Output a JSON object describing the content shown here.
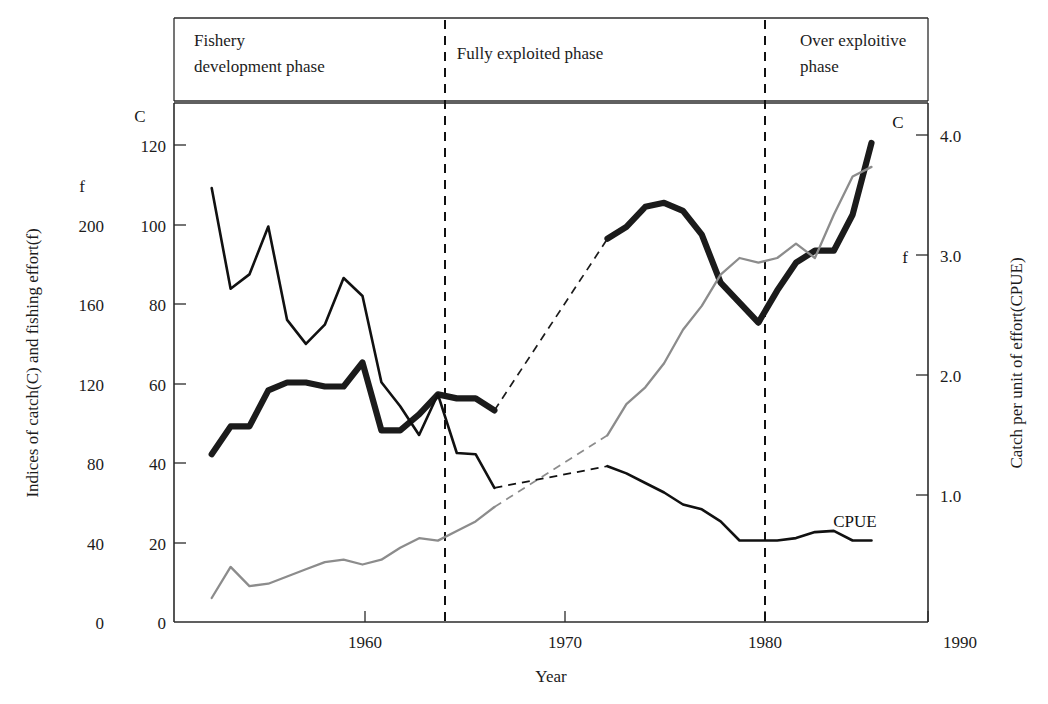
{
  "chart_data": {
    "type": "line",
    "title": "",
    "xlabel": "Year",
    "ylabel": "Indices of catch(C) and fishing effort(f)",
    "y2label": "Catch per unit of effort(CPUE)",
    "xlim": [
      1950,
      1990
    ],
    "xticks": [
      "1960",
      "1970",
      "1980",
      "1990"
    ],
    "xtick_values": [
      1960,
      1970,
      1980,
      1990
    ],
    "grid": false,
    "legend_position": "inline-right-end",
    "axis_c": {
      "name": "C",
      "unit_label": "C",
      "ticks": [
        "0",
        "20",
        "40",
        "60",
        "80",
        "100",
        "120"
      ],
      "tick_values": [
        0,
        20,
        40,
        60,
        80,
        100,
        120
      ],
      "ylim": [
        0,
        130
      ]
    },
    "axis_f": {
      "name": "f",
      "unit_label": "f",
      "ticks": [
        "0",
        "40",
        "80",
        "120",
        "160",
        "200"
      ],
      "tick_values": [
        0,
        40,
        80,
        120,
        160,
        200
      ],
      "ylim": [
        0,
        216.7
      ]
    },
    "axis_cpue": {
      "name": "CPUE",
      "ticks": [
        "1.0",
        "2.0",
        "3.0",
        "4.0"
      ],
      "tick_values": [
        1.0,
        2.0,
        3.0,
        4.0
      ],
      "ylim": [
        0,
        4.33
      ]
    },
    "series": [
      {
        "name": "C",
        "label": "C",
        "axis": "axis_c",
        "style": "thick-black",
        "x": [
          1952,
          1953,
          1954,
          1955,
          1956,
          1957,
          1958,
          1959,
          1960,
          1961,
          1962,
          1963,
          1964,
          1965,
          1966,
          1967,
          1973,
          1974,
          1975,
          1976,
          1977,
          1978,
          1979,
          1980,
          1981,
          1982,
          1983,
          1984,
          1985,
          1986,
          1987
        ],
        "values": [
          42,
          49,
          49,
          58,
          60,
          60,
          59,
          59,
          65,
          48,
          48,
          52,
          57,
          56,
          56,
          53,
          96,
          99,
          104,
          105,
          103,
          97,
          85,
          80,
          75,
          83,
          90,
          93,
          93,
          102,
          120
        ]
      },
      {
        "name": "f",
        "label": "f",
        "axis": "axis_f",
        "style": "thin-gray",
        "x": [
          1952,
          1953,
          1954,
          1955,
          1956,
          1957,
          1958,
          1959,
          1960,
          1961,
          1962,
          1963,
          1964,
          1965,
          1966,
          1967,
          1973,
          1974,
          1975,
          1976,
          1977,
          1978,
          1979,
          1980,
          1981,
          1982,
          1983,
          1984,
          1985,
          1986,
          1987
        ],
        "values": [
          10,
          23,
          15,
          16,
          19,
          22,
          25,
          26,
          24,
          26,
          31,
          35,
          34,
          38,
          42,
          48,
          78,
          91,
          98,
          108,
          122,
          132,
          145,
          152,
          150,
          152,
          158,
          152,
          170,
          186,
          190
        ]
      },
      {
        "name": "CPUE",
        "label": "CPUE",
        "axis": "axis_cpue",
        "style": "thin-black",
        "x": [
          1952,
          1953,
          1954,
          1955,
          1956,
          1957,
          1958,
          1959,
          1960,
          1961,
          1962,
          1963,
          1964,
          1965,
          1966,
          1967,
          1973,
          1974,
          1975,
          1976,
          1977,
          1978,
          1979,
          1980,
          1981,
          1982,
          1983,
          1984,
          1985,
          1986,
          1987
        ],
        "values": [
          3.62,
          2.78,
          2.9,
          3.3,
          2.52,
          2.32,
          2.48,
          2.87,
          2.72,
          2.0,
          1.8,
          1.56,
          1.9,
          1.41,
          1.4,
          1.12,
          1.3,
          1.24,
          1.16,
          1.08,
          0.98,
          0.94,
          0.84,
          0.68,
          0.68,
          0.68,
          0.7,
          0.75,
          0.76,
          0.68,
          0.68
        ]
      }
    ],
    "data_gap": {
      "from_year": 1967,
      "to_year": 1973,
      "style": "dashed-interpolation",
      "applies_to": [
        "C",
        "f",
        "CPUE"
      ]
    },
    "phases": [
      {
        "id": "development",
        "label": "Fishery\ndevelopment phase",
        "line1": "Fishery",
        "line2": "development phase",
        "start": 1950,
        "end": 1964
      },
      {
        "id": "fully-exploited",
        "label": "Fully exploited phase",
        "line1": "Fully exploited phase",
        "line2": "",
        "start": 1964,
        "end": 1980
      },
      {
        "id": "over-exploitive",
        "label": "Over exploitive\nphase",
        "line1": "Over exploitive",
        "line2": "phase",
        "start": 1980,
        "end": 1990
      }
    ],
    "phase_dividers": [
      1964,
      1980
    ],
    "colors": {
      "catch": "#1b1b1b",
      "effort": "#8c8c8c",
      "cpue": "#111111",
      "axis": "#2b2b2b",
      "background": "#ffffff"
    }
  }
}
